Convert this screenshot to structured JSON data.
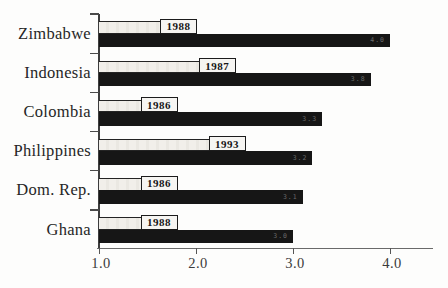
{
  "figure": {
    "background": "#fdfdfc"
  },
  "chart_data": {
    "type": "bar",
    "orientation": "horizontal",
    "title": "",
    "xlabel": "",
    "ylabel": "",
    "xlim": [
      1.0,
      4.45
    ],
    "x_ticks": [
      "1.0",
      "2.0",
      "3.0",
      "4.0"
    ],
    "x_tick_values": [
      1.0,
      2.0,
      3.0,
      4.0
    ],
    "grid": false,
    "legend_position": "none",
    "categories": [
      "Zimbabwe",
      "Indonesia",
      "Colombia",
      "Philippines",
      "Dom. Rep.",
      "Ghana"
    ],
    "series": [
      {
        "name": "light-survey-year-bar",
        "style": "light-outlined",
        "color": "#f0eee9",
        "values": [
          2.0,
          2.4,
          1.8,
          2.5,
          1.8,
          1.8
        ],
        "bar_labels": [
          "1988",
          "1987",
          "1986",
          "1993",
          "1986",
          "1988"
        ],
        "bar_label_style": "boxed-year-at-bar-end"
      },
      {
        "name": "dark-value-bar",
        "style": "solid-dark",
        "color": "#161616",
        "values": [
          4.0,
          3.8,
          3.3,
          3.2,
          3.1,
          3.0
        ],
        "bar_labels": [
          "4.0",
          "3.8",
          "3.3",
          "3.2",
          "3.1",
          "3.0"
        ],
        "bar_label_style": "faint-tiny-inside-end"
      }
    ]
  }
}
